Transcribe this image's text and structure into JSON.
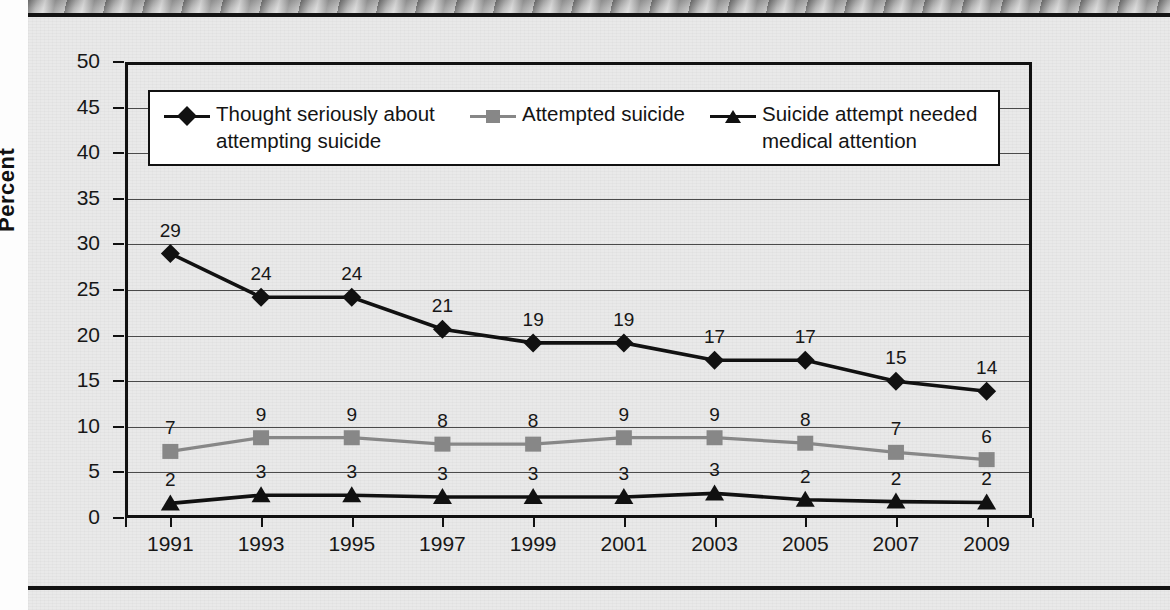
{
  "chart_data": {
    "type": "line",
    "title": "",
    "xlabel": "",
    "ylabel": "Percent",
    "categories": [
      "1991",
      "1993",
      "1995",
      "1997",
      "1999",
      "2001",
      "2003",
      "2005",
      "2007",
      "2009"
    ],
    "ylim": [
      0,
      50
    ],
    "ytick_step": 5,
    "yticks": [
      "50",
      "45",
      "40",
      "35",
      "30",
      "25",
      "20",
      "15",
      "10",
      "5",
      "0"
    ],
    "grid": true,
    "legend_position": "inside-top",
    "series": [
      {
        "name": "Thought seriously about attempting suicide",
        "marker": "diamond",
        "color": "#111111",
        "values": [
          29,
          24,
          24,
          21,
          19,
          19,
          17,
          17,
          15,
          14
        ],
        "plot_values": [
          29.0,
          24.2,
          24.2,
          20.7,
          19.2,
          19.2,
          17.3,
          17.3,
          15.0,
          13.9
        ],
        "labels": [
          "29",
          "24",
          "24",
          "21",
          "19",
          "19",
          "17",
          "17",
          "15",
          "14"
        ]
      },
      {
        "name": "Attempted suicide",
        "marker": "square",
        "color": "#878787",
        "values": [
          7,
          9,
          9,
          8,
          8,
          9,
          9,
          8,
          7,
          6
        ],
        "plot_values": [
          7.3,
          8.8,
          8.8,
          8.1,
          8.1,
          8.8,
          8.8,
          8.2,
          7.2,
          6.4
        ],
        "labels": [
          "7",
          "9",
          "9",
          "8",
          "8",
          "9",
          "9",
          "8",
          "7",
          "6"
        ]
      },
      {
        "name": "Suicide attempt needed medical attention",
        "marker": "triangle",
        "color": "#111111",
        "values": [
          2,
          3,
          3,
          3,
          3,
          3,
          3,
          2,
          2,
          2
        ],
        "plot_values": [
          1.6,
          2.5,
          2.5,
          2.3,
          2.3,
          2.3,
          2.7,
          2.0,
          1.8,
          1.7
        ],
        "labels": [
          "2",
          "3",
          "3",
          "3",
          "3",
          "3",
          "3",
          "2",
          "2",
          "2"
        ]
      }
    ]
  },
  "legend": {
    "entries": [
      {
        "label": "Thought seriously about\nattempting suicide",
        "marker": "diamond",
        "color": "#111111"
      },
      {
        "label": "Attempted suicide",
        "marker": "square",
        "color": "#878787"
      },
      {
        "label": "Suicide attempt needed\nmedical attention",
        "marker": "triangle",
        "color": "#111111"
      }
    ]
  },
  "axes": {
    "y_title": "Percent",
    "y_ticks": [
      "50",
      "45",
      "40",
      "35",
      "30",
      "25",
      "20",
      "15",
      "10",
      "5",
      "0"
    ],
    "x_ticks": [
      "1991",
      "1993",
      "1995",
      "1997",
      "1999",
      "2001",
      "2003",
      "2005",
      "2007",
      "2009"
    ]
  }
}
